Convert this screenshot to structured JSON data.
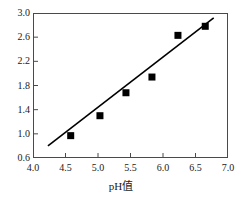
{
  "chart_data": {
    "type": "scatter",
    "title": "",
    "xlabel": "pH值",
    "ylabel": "",
    "xlim": [
      4.0,
      7.0
    ],
    "ylim": [
      0.6,
      3.0
    ],
    "grid": false,
    "legend": null,
    "xticks": [
      "4.0",
      "4.5",
      "5.0",
      "5.5",
      "6.0",
      "6.5",
      "7.0"
    ],
    "xtick_values": [
      4.0,
      4.5,
      5.0,
      5.5,
      6.0,
      6.5,
      7.0
    ],
    "yticks": [
      "0.6",
      "1.0",
      "1.4",
      "1.8",
      "2.2",
      "2.6",
      "3.0"
    ],
    "ytick_values": [
      0.6,
      1.0,
      1.4,
      1.8,
      2.2,
      2.6,
      3.0
    ],
    "marker": "filled-square",
    "marker_color": "#000000",
    "line_color": "#000000",
    "points": [
      {
        "x": 4.58,
        "y": 0.97
      },
      {
        "x": 5.03,
        "y": 1.3
      },
      {
        "x": 5.43,
        "y": 1.68
      },
      {
        "x": 5.83,
        "y": 1.94
      },
      {
        "x": 6.23,
        "y": 2.63
      },
      {
        "x": 6.65,
        "y": 2.78
      }
    ],
    "trendline": {
      "x_start": 4.23,
      "y_start": 0.8,
      "x_end": 6.78,
      "y_end": 2.92
    }
  }
}
